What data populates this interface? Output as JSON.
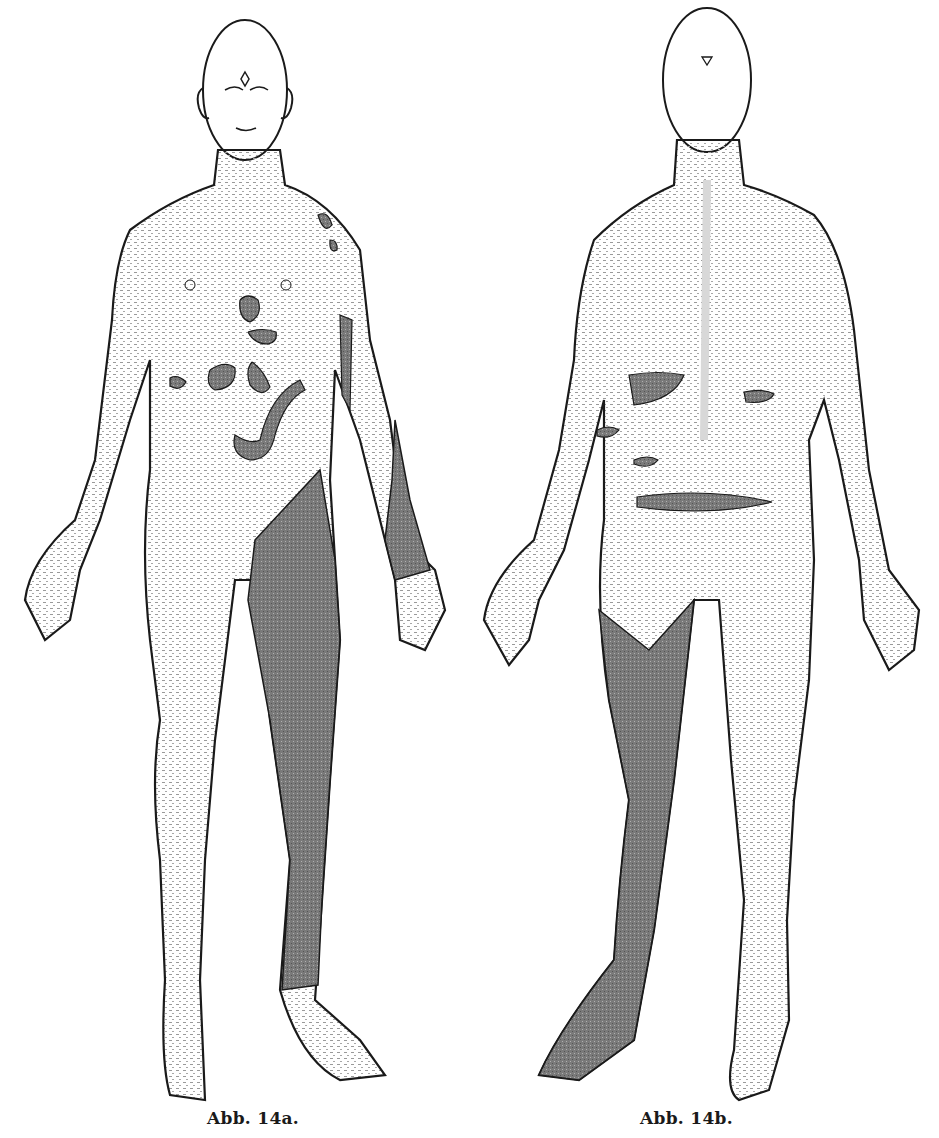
{
  "document": {
    "type": "anatomical illustration",
    "background_color": "#ffffff",
    "ink_color": "#1a1a1a",
    "shading_color": "#6e6e6e",
    "skin_stipple_color": "#9a9a9a"
  },
  "figures": [
    {
      "id": "14a",
      "caption": "Abb. 14a.",
      "view": "anterior (front) view of human body",
      "markers": "small triangles mark test points; one diamond on forehead",
      "shaded_regions": [
        "left shoulder patches",
        "sternum patch",
        "upper abdomen band",
        "two abdominal patches",
        "left flank patch",
        "curved inguinal band",
        "left inner forearm strip",
        "left distal forearm/wrist",
        "entire left thigh and lower leg to ankle"
      ]
    },
    {
      "id": "14b",
      "caption": "Abb. 14b.",
      "view": "posterior (back) view of human body",
      "markers": "small triangles mark test points",
      "shaded_regions": [
        "left lower back patch",
        "right lower back patch",
        "left flank patches",
        "sacral band",
        "entire right posterior leg from buttock fold to foot"
      ]
    }
  ]
}
